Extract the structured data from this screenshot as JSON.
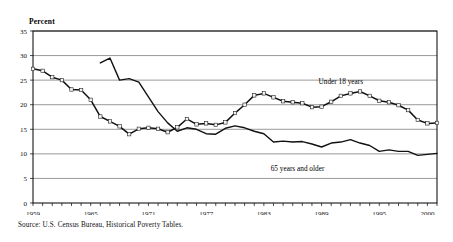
{
  "figure": {
    "y_axis_title": "Percent",
    "source_note": "Source: U.S. Census Bureau, Historical Poverty Tables."
  },
  "chart_data": {
    "type": "line",
    "title": "",
    "xlabel": "",
    "ylabel": "Percent",
    "xlim": [
      1959,
      2001
    ],
    "ylim": [
      0,
      35
    ],
    "ytick_values": [
      0,
      5,
      10,
      15,
      20,
      25,
      30,
      35
    ],
    "ytick_labels": [
      "0",
      "5",
      "10",
      "15",
      "20",
      "25",
      "30",
      "35"
    ],
    "xtick_values": [
      1959,
      1965,
      1971,
      1977,
      1983,
      1989,
      1995,
      2000
    ],
    "xtick_labels": [
      "1959",
      "1965",
      "1971",
      "1977",
      "1983",
      "1989",
      "1995",
      "2000"
    ],
    "minor_xticks_every": 1,
    "grid": "horizontal",
    "legend": "inline-annotations",
    "annotations": [
      {
        "text": "Under 18 years",
        "x": 1991.0,
        "y": 24.2
      },
      {
        "text": "65 years and older",
        "x": 1986.5,
        "y": 6.6
      }
    ],
    "series": [
      {
        "name": "Under 18 years",
        "marker": "open-square",
        "x": [
          1959,
          1960,
          1961,
          1962,
          1963,
          1964,
          1965,
          1966,
          1967,
          1968,
          1969,
          1970,
          1971,
          1972,
          1973,
          1974,
          1975,
          1976,
          1977,
          1978,
          1979,
          1980,
          1981,
          1982,
          1983,
          1984,
          1985,
          1986,
          1987,
          1988,
          1989,
          1990,
          1991,
          1992,
          1993,
          1994,
          1995,
          1996,
          1997,
          1998,
          1999,
          2000,
          2001
        ],
        "values": [
          27.3,
          26.9,
          25.6,
          25.0,
          23.1,
          23.0,
          21.0,
          17.6,
          16.6,
          15.6,
          14.0,
          15.1,
          15.3,
          15.1,
          14.4,
          15.4,
          17.1,
          16.0,
          16.2,
          15.9,
          16.4,
          18.3,
          20.0,
          21.9,
          22.3,
          21.5,
          20.7,
          20.5,
          20.3,
          19.5,
          19.6,
          20.6,
          21.8,
          22.3,
          22.7,
          21.8,
          20.8,
          20.5,
          19.9,
          18.9,
          16.9,
          16.2,
          16.3
        ]
      },
      {
        "name": "65 years and older",
        "marker": "none",
        "x": [
          1966,
          1967,
          1968,
          1969,
          1970,
          1971,
          1972,
          1973,
          1974,
          1975,
          1976,
          1977,
          1978,
          1979,
          1980,
          1981,
          1982,
          1983,
          1984,
          1985,
          1986,
          1987,
          1988,
          1989,
          1990,
          1991,
          1992,
          1993,
          1994,
          1995,
          1996,
          1997,
          1998,
          1999,
          2000,
          2001
        ],
        "values": [
          28.5,
          29.5,
          25.0,
          25.3,
          24.6,
          21.6,
          18.6,
          16.3,
          14.6,
          15.3,
          15.0,
          14.1,
          14.0,
          15.2,
          15.7,
          15.3,
          14.6,
          14.1,
          12.4,
          12.6,
          12.4,
          12.5,
          12.0,
          11.4,
          12.2,
          12.4,
          12.9,
          12.2,
          11.7,
          10.5,
          10.8,
          10.5,
          10.5,
          9.7,
          9.9,
          10.1
        ]
      }
    ]
  }
}
